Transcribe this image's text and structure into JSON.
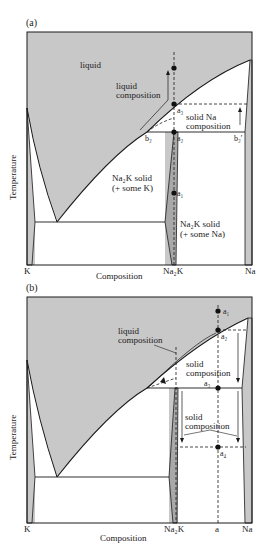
{
  "figure": {
    "panels": [
      {
        "id": "a",
        "label": "(a)",
        "y_axis_label": "Temperature",
        "x_axis_label": "Composition",
        "x_ticks": [
          "K",
          "Na2K",
          "Na"
        ],
        "x_ticks_display": [
          "K",
          "Na₂K",
          "Na"
        ],
        "region_labels": {
          "liquid": "liquid",
          "liquid_composition_1": "liquid",
          "liquid_composition_2": "composition",
          "solid_na_1": "solid  Na",
          "solid_na_2": "composition",
          "na2k_k_1": "Na₂K  solid",
          "na2k_k_2": "(+  some  K)",
          "na2k_na_1": "Na₂K  solid",
          "na2k_na_2": "(+  some  Na)"
        },
        "points": {
          "a1": "a₁",
          "a2": "a₂",
          "a3": "a₃",
          "b2": "b₂",
          "b2p": "b₂′"
        }
      },
      {
        "id": "b",
        "label": "(b)",
        "y_axis_label": "Temperature",
        "x_axis_label": "Composition",
        "x_ticks_display": [
          "K",
          "Na₂K",
          "a",
          "Na"
        ],
        "region_labels": {
          "liquid_composition_1": "liquid",
          "liquid_composition_2": "composition",
          "solid_composition_upper_1": "solid",
          "solid_composition_upper_2": "composition",
          "solid_composition_lower_1": "solid",
          "solid_composition_lower_2": "composition"
        },
        "points": {
          "a1": "a₁",
          "a2": "a₂",
          "a3": "a₃",
          "a4": "a₄"
        }
      }
    ],
    "colors": {
      "shade": "#c8c8c8",
      "line": "#1a1a1a",
      "background": "#ffffff"
    }
  }
}
